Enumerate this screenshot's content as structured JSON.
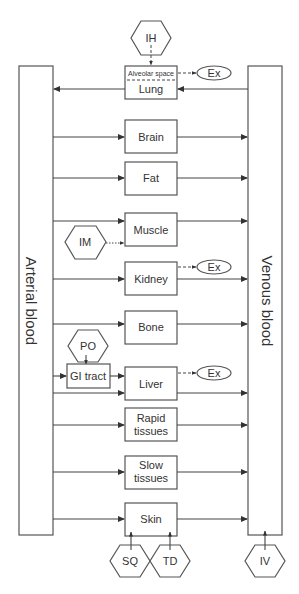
{
  "diagram": {
    "blood": {
      "arterial": "Arterial blood",
      "venous": "Venous blood"
    },
    "lung": {
      "label": "Lung",
      "sublabel": "Alveolar space"
    },
    "organs": [
      {
        "id": "brain",
        "lines": [
          "Brain"
        ]
      },
      {
        "id": "fat",
        "lines": [
          "Fat"
        ]
      },
      {
        "id": "muscle",
        "lines": [
          "Muscle"
        ]
      },
      {
        "id": "kidney",
        "lines": [
          "Kidney"
        ]
      },
      {
        "id": "bone",
        "lines": [
          "Bone"
        ]
      },
      {
        "id": "liver",
        "lines": [
          "Liver"
        ]
      },
      {
        "id": "rapid",
        "lines": [
          "Rapid",
          "tissues"
        ]
      },
      {
        "id": "slow",
        "lines": [
          "Slow",
          "tissues"
        ]
      },
      {
        "id": "skin",
        "lines": [
          "Skin"
        ]
      }
    ],
    "gi_tract": "GI tract",
    "excretion_label": "Ex",
    "routes": {
      "inhalation": "IH",
      "intramuscular": "IM",
      "oral": "PO",
      "subcutaneous": "SQ",
      "transdermal": "TD",
      "intravenous": "IV"
    },
    "colors": {
      "stroke": "#555555",
      "text": "#333333",
      "background": "#ffffff"
    }
  }
}
